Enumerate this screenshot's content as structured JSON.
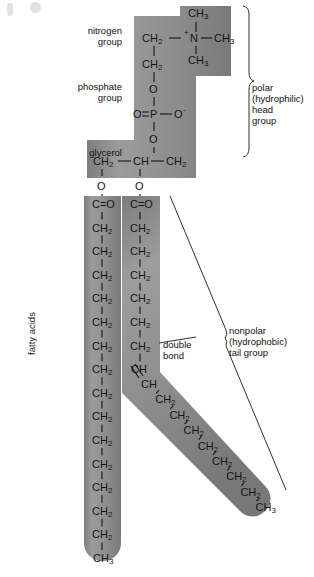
{
  "figure": {
    "fill_color": "#8f8f8f",
    "stroke_color": "#1a1a1a",
    "background": "#ffffff"
  },
  "labels": {
    "nitrogen_group": "nitrogen\ngroup",
    "nitrogen_group_line1": "nitrogen",
    "nitrogen_group_line2": "group",
    "phosphate_group_line1": "phosphate",
    "phosphate_group_line2": "group",
    "glycerol": "glycerol",
    "fatty_acids": "fatty acids",
    "double_bond_line1": "double",
    "double_bond_line2": "bond",
    "polar_line1": "polar",
    "polar_line2": "(hydrophilic)",
    "polar_line3": "head",
    "polar_line4": "group",
    "nonpolar_line1": "nonpolar",
    "nonpolar_line2": "(hydrophobic)",
    "nonpolar_line3": "tail group"
  },
  "chemistry": {
    "choline": {
      "n_label": "N",
      "n_charge": "+",
      "methyl_top": "CH3",
      "methyl_right": "CH3",
      "methyl_bottom": "CH3",
      "ch2_upper": "CH2",
      "ch2_lower": "CH2"
    },
    "phosphate": {
      "o_top": "O",
      "o_left": "O",
      "p": "P",
      "o_right": "O",
      "o_right_charge": "-",
      "o_bottom": "O",
      "left_bond": "double",
      "right_bond": "single"
    },
    "glycerol": {
      "c1": "CH2",
      "c2": "CH",
      "c3": "CH2",
      "o1": "O",
      "o2": "O"
    },
    "tail_saturated": {
      "name": "saturated fatty acid",
      "head": "C=O",
      "units": [
        "CH2",
        "CH2",
        "CH2",
        "CH2",
        "CH2",
        "CH2",
        "CH2",
        "CH2",
        "CH2",
        "CH2",
        "CH2",
        "CH2",
        "CH2",
        "CH2"
      ],
      "terminal": "CH3"
    },
    "tail_unsaturated": {
      "name": "unsaturated fatty acid",
      "head": "C=O",
      "units_before_double_bond": [
        "CH2",
        "CH2",
        "CH2",
        "CH2",
        "CH2",
        "CH2"
      ],
      "double_bond_top": "CH",
      "double_bond_bottom": "CH",
      "units_after_double_bond": [
        "CH2",
        "CH2",
        "CH2",
        "CH2",
        "CH2",
        "CH2",
        "CH2"
      ],
      "terminal": "CH3"
    }
  }
}
